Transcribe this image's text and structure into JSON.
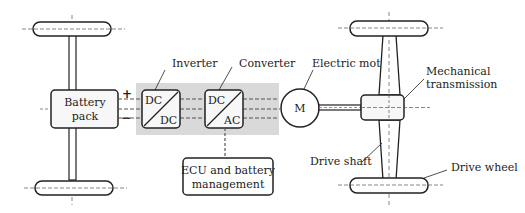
{
  "diagram": {
    "type": "electric-vehicle-drivetrain",
    "battery": {
      "line1": "Battery",
      "line2": "pack",
      "plus": "+",
      "minus": "−"
    },
    "inverter": {
      "label": "Inverter",
      "top": "DC",
      "bottom": "DC"
    },
    "converter": {
      "label": "Converter",
      "top": "DC",
      "bottom": "AC"
    },
    "motor": {
      "label": "Electric motor",
      "symbol": "M"
    },
    "transmission": {
      "line1": "Mechanical",
      "line2": "transmission"
    },
    "ecu": {
      "line1": "ECU and battery",
      "line2": "management"
    },
    "drive_shaft": {
      "label": "Drive shaft"
    },
    "drive_wheel": {
      "label": "Drive wheel"
    },
    "colors": {
      "stroke": "#222222",
      "shade": "#d9d9d9",
      "box_fill": "#f7f7f7"
    }
  }
}
